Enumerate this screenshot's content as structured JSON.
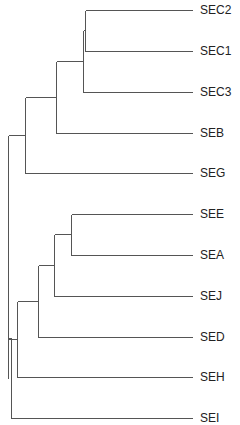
{
  "diagram": {
    "type": "dendrogram",
    "orientation": "left-to-right",
    "line_color": "#555555",
    "label_color": "#222222",
    "leaves": [
      {
        "label": "SEC2",
        "y": 10
      },
      {
        "label": "SEC1",
        "y": 51
      },
      {
        "label": "SEC3",
        "y": 92
      },
      {
        "label": "SEB",
        "y": 133
      },
      {
        "label": "SEG",
        "y": 173
      },
      {
        "label": "SEE",
        "y": 214
      },
      {
        "label": "SEA",
        "y": 255
      },
      {
        "label": "SEJ",
        "y": 296
      },
      {
        "label": "SED",
        "y": 337
      },
      {
        "label": "SEH",
        "y": 377
      },
      {
        "label": "SEI",
        "y": 418
      }
    ],
    "clusters": [
      {
        "members": [
          "SEC2",
          "SEC1"
        ],
        "x": 85
      },
      {
        "members": [
          "SEC2",
          "SEC1",
          "SEC3"
        ],
        "x": 83
      },
      {
        "members": [
          "SEC2",
          "SEC1",
          "SEC3",
          "SEB"
        ],
        "x": 56
      },
      {
        "members": [
          "SEC2",
          "SEC1",
          "SEC3",
          "SEB",
          "SEG"
        ],
        "x": 25
      },
      {
        "members": [
          "SEE",
          "SEA"
        ],
        "x": 71
      },
      {
        "members": [
          "SEE",
          "SEA",
          "SEJ"
        ],
        "x": 54
      },
      {
        "members": [
          "SEE",
          "SEA",
          "SEJ",
          "SED"
        ],
        "x": 38
      },
      {
        "members": [
          "SEE",
          "SEA",
          "SEJ",
          "SED",
          "SEH"
        ],
        "x": 17
      },
      {
        "members": [
          "top-group",
          "bottom-group"
        ],
        "x": 8
      },
      {
        "members": [
          "all",
          "SEI"
        ],
        "x": 11
      }
    ]
  }
}
